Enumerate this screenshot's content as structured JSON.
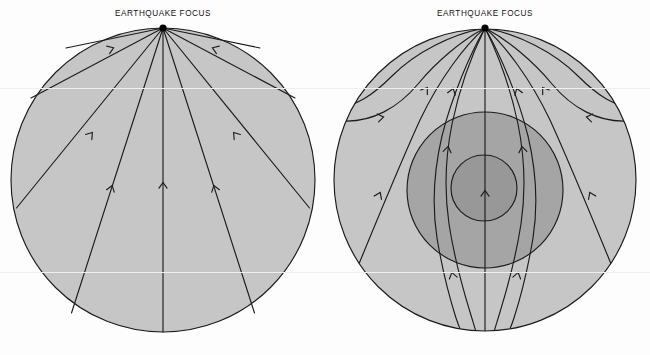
{
  "figure": {
    "width": 650,
    "height": 355,
    "background_color": "#fdfdfd"
  },
  "panels": [
    {
      "id": "homogeneous-earth",
      "title": "EARTHQUAKE FOCUS",
      "title_x": 163,
      "description": "Straight seismic ray paths radiating from an earthquake focus through a uniform Earth",
      "earth": {
        "cx": 163,
        "cy": 180,
        "r": 152
      },
      "focus": {
        "x": 163,
        "y": 28,
        "r": 3.6
      },
      "layers": [
        {
          "name": "uniform-earth",
          "color": "#c6c6c6",
          "r": 152
        }
      ],
      "rays": [
        {
          "name": "ray-left-80",
          "angle_deg": -80,
          "type": "straight"
        },
        {
          "name": "ray-left-58",
          "angle_deg": -58,
          "type": "straight"
        },
        {
          "name": "ray-left-38",
          "angle_deg": -38,
          "type": "straight"
        },
        {
          "name": "ray-left-21",
          "angle_deg": -21,
          "type": "straight"
        },
        {
          "name": "ray-center-0",
          "angle_deg": 0,
          "type": "straight"
        },
        {
          "name": "ray-right-21",
          "angle_deg": 21,
          "type": "straight"
        },
        {
          "name": "ray-right-38",
          "angle_deg": 38,
          "type": "straight"
        },
        {
          "name": "ray-right-58",
          "angle_deg": 58,
          "type": "straight"
        },
        {
          "name": "ray-right-80",
          "angle_deg": 80,
          "type": "straight"
        }
      ]
    },
    {
      "id": "layered-earth",
      "title": "EARTHQUAKE FOCUS",
      "title_x": 485,
      "description": "Curved and refracted seismic ray paths through a layered Earth with mantle, outer core and inner core",
      "earth": {
        "cx": 485,
        "cy": 180,
        "r": 151
      },
      "focus": {
        "x": 485,
        "y": 28,
        "r": 3.6
      },
      "layers": [
        {
          "name": "mantle",
          "color": "#c6c6c6",
          "cx": 485,
          "cy": 180,
          "r": 151
        },
        {
          "name": "outer-core",
          "color": "#a5a5a5",
          "cx": 485,
          "cy": 190,
          "r": 78
        },
        {
          "name": "inner-core",
          "color": "#989898",
          "cx": 484,
          "cy": 188,
          "r": 33
        }
      ],
      "rays": [
        {
          "name": "ray-refracted-left-outer",
          "type": "curved-returning"
        },
        {
          "name": "ray-refracted-left-mid",
          "type": "curved-returning"
        },
        {
          "name": "ray-core-left-outer",
          "type": "core-refracted"
        },
        {
          "name": "ray-core-left-inner",
          "type": "core-refracted"
        },
        {
          "name": "ray-center-0",
          "type": "straight"
        },
        {
          "name": "ray-core-right-inner",
          "type": "core-refracted"
        },
        {
          "name": "ray-core-right-outer",
          "type": "core-refracted"
        },
        {
          "name": "ray-refracted-right-mid",
          "type": "curved-returning"
        },
        {
          "name": "ray-refracted-right-outer",
          "type": "curved-returning"
        }
      ]
    }
  ],
  "style": {
    "ray_color": "#1c1c1c",
    "ray_width": 1.15,
    "boundary_color": "#1c1c1c",
    "boundary_width": 1.15,
    "focus_color": "#000000",
    "title_color": "#141414",
    "scanline_color": "#efefef"
  }
}
